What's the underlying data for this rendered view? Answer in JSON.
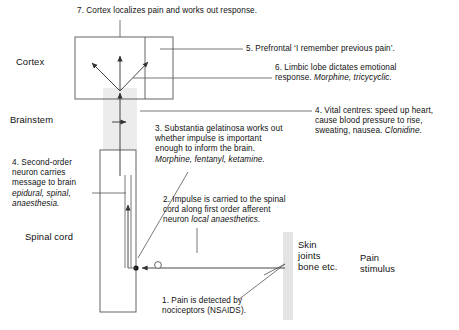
{
  "figure": {
    "regions": [
      {
        "id": "cortex",
        "label": "Cortex"
      },
      {
        "id": "brainstem",
        "label": "Brainstem"
      },
      {
        "id": "spinal-cord",
        "label": "Spinal cord"
      },
      {
        "id": "skin",
        "label": "Skin\njoints\nbone etc."
      },
      {
        "id": "stimulus",
        "label": "Pain\nstimulus"
      }
    ],
    "annotations": [
      {
        "id": "note-7",
        "number": "7",
        "text": "7. Cortex localizes pain and works out response."
      },
      {
        "id": "note-5",
        "number": "5",
        "text": "5. Prefrontal ‘I remember previous pain’."
      },
      {
        "id": "note-6",
        "number": "6",
        "text": "6. Limbic lobe dictates emotional\nresponse. ",
        "emphasis": "Morphine, tricycyclic."
      },
      {
        "id": "note-4-vital",
        "number": "4",
        "text": "4. Vital centres: speed up heart,\ncause blood pressure to rise,\nsweating, nausea. ",
        "emphasis": "Clonidine."
      },
      {
        "id": "note-3",
        "number": "3",
        "text": "3. Substantia gelatinosa works out\nwhether impulse is important\nenough to inform the brain.\n",
        "emphasis": "Morphine, fentanyl, ketamine."
      },
      {
        "id": "note-4-neuron",
        "number": "4",
        "text": "4. Second-order\nneuron carries\nmessage to brain\n",
        "emphasis": "epidural, spinal,\nanaesthesia."
      },
      {
        "id": "note-2",
        "number": "2",
        "text": "2. Impulse is carried to the spinal\ncord along first order afferent\nneuron ",
        "emphasis": "local anaesthetics."
      },
      {
        "id": "note-1",
        "number": "1",
        "text": "1. Pain is detected by\nnociceptors (NSAIDS)."
      }
    ],
    "caption_strip": "",
    "colors": {
      "line": "#555555",
      "shade": "#e6e6e6",
      "text": "#111111"
    }
  }
}
